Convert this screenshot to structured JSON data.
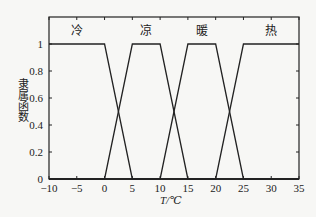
{
  "chart_data": {
    "type": "line",
    "title": "",
    "xlabel": "T/℃",
    "ylabel": "隶属函数",
    "xlim": [
      -10,
      35
    ],
    "ylim": [
      0,
      1
    ],
    "x_ticks": [
      -10,
      -5,
      0,
      5,
      10,
      15,
      20,
      25,
      30,
      35
    ],
    "y_ticks": [
      0,
      0.2,
      0.4,
      0.6,
      0.8,
      1
    ],
    "y_tick_labels": [
      "0",
      "0.2",
      "0.4",
      "0.6",
      "0.8",
      "1"
    ],
    "grid": false,
    "legend": "inline category labels at top",
    "series": [
      {
        "name": "冷",
        "x": [
          -10,
          0,
          5,
          35
        ],
        "y": [
          1,
          1,
          0,
          0
        ]
      },
      {
        "name": "凉",
        "x": [
          -10,
          0,
          5,
          10,
          15,
          35
        ],
        "y": [
          0,
          0,
          1,
          1,
          0,
          0
        ]
      },
      {
        "name": "暖",
        "x": [
          -10,
          10,
          15,
          20,
          25,
          35
        ],
        "y": [
          0,
          0,
          1,
          1,
          0,
          0
        ]
      },
      {
        "name": "热",
        "x": [
          -10,
          20,
          25,
          35
        ],
        "y": [
          0,
          0,
          1,
          1
        ]
      }
    ],
    "category_labels": [
      {
        "text": "冷",
        "x": -5
      },
      {
        "text": "凉",
        "x": 7.5
      },
      {
        "text": "暖",
        "x": 17.5
      },
      {
        "text": "热",
        "x": 30
      }
    ]
  }
}
